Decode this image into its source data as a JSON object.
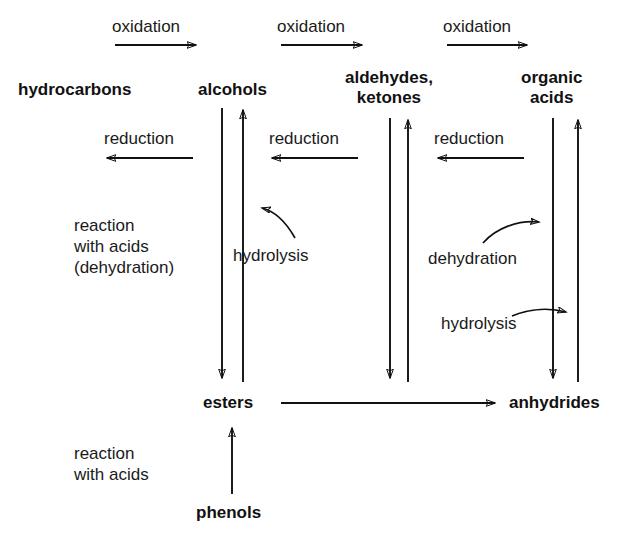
{
  "diagram": {
    "type": "reaction-pathway-flow-diagram",
    "background_color": "#ffffff",
    "stroke_color": "#111111",
    "nodes": [
      {
        "id": "hydrocarbons",
        "label": "hydrocarbons",
        "x": 18,
        "y": 80
      },
      {
        "id": "alcohols",
        "label": "alcohols",
        "x": 198,
        "y": 80
      },
      {
        "id": "aldehydes_ketones",
        "label": "aldehydes,\nketones",
        "x": 345,
        "y": 68
      },
      {
        "id": "organic_acids",
        "label": "organic\nacids",
        "x": 521,
        "y": 68
      },
      {
        "id": "esters",
        "label": "esters",
        "x": 203,
        "y": 395
      },
      {
        "id": "anhydrides",
        "label": "anhydrides",
        "x": 509,
        "y": 395
      },
      {
        "id": "phenols",
        "label": "phenols",
        "x": 196,
        "y": 505
      }
    ],
    "edge_labels": [
      {
        "id": "oxidation_1",
        "label": "oxidation",
        "x": 112,
        "y": 16
      },
      {
        "id": "oxidation_2",
        "label": "oxidation",
        "x": 277,
        "y": 16
      },
      {
        "id": "oxidation_3",
        "label": "oxidation",
        "x": 443,
        "y": 16
      },
      {
        "id": "reduction_1",
        "label": "reduction",
        "x": 104,
        "y": 128
      },
      {
        "id": "reduction_2",
        "label": "reduction",
        "x": 269,
        "y": 128
      },
      {
        "id": "reduction_3",
        "label": "reduction",
        "x": 434,
        "y": 128
      },
      {
        "id": "reaction_with_acids_dehydration",
        "label": "reaction\nwith acids\n(dehydration)",
        "x": 74,
        "y": 215
      },
      {
        "id": "hydrolysis_1",
        "label": "hydrolysis",
        "x": 233,
        "y": 245
      },
      {
        "id": "dehydration_1",
        "label": "dehydration",
        "x": 428,
        "y": 248
      },
      {
        "id": "hydrolysis_2",
        "label": "hydrolysis",
        "x": 441,
        "y": 313
      },
      {
        "id": "reaction_with_acids",
        "label": "reaction\nwith acids",
        "x": 74,
        "y": 443
      }
    ],
    "relations": [
      {
        "from": "hydrocarbons",
        "to": "alcohols",
        "label": "oxidation",
        "direction": "right"
      },
      {
        "from": "alcohols",
        "to": "aldehydes_ketones",
        "label": "oxidation",
        "direction": "right"
      },
      {
        "from": "aldehydes_ketones",
        "to": "organic_acids",
        "label": "oxidation",
        "direction": "right"
      },
      {
        "from": "alcohols",
        "to": "hydrocarbons",
        "label": "reduction",
        "direction": "left"
      },
      {
        "from": "aldehydes_ketones",
        "to": "alcohols",
        "label": "reduction",
        "direction": "left"
      },
      {
        "from": "organic_acids",
        "to": "aldehydes_ketones",
        "label": "reduction",
        "direction": "left"
      },
      {
        "from": "alcohols",
        "to": "esters",
        "label": "reaction with acids (dehydration)",
        "direction": "down"
      },
      {
        "from": "esters",
        "to": "alcohols",
        "label": "hydrolysis",
        "direction": "up"
      },
      {
        "from": "aldehydes_ketones",
        "to": "esters",
        "label": "",
        "direction": "down"
      },
      {
        "from": "esters",
        "to": "aldehydes_ketones",
        "label": "",
        "direction": "up"
      },
      {
        "from": "organic_acids",
        "to": "anhydrides",
        "label": "dehydration",
        "direction": "down"
      },
      {
        "from": "anhydrides",
        "to": "organic_acids",
        "label": "hydrolysis",
        "direction": "up"
      },
      {
        "from": "esters",
        "to": "anhydrides",
        "label": "",
        "direction": "right"
      },
      {
        "from": "phenols",
        "to": "esters",
        "label": "reaction with acids",
        "direction": "up"
      }
    ]
  }
}
